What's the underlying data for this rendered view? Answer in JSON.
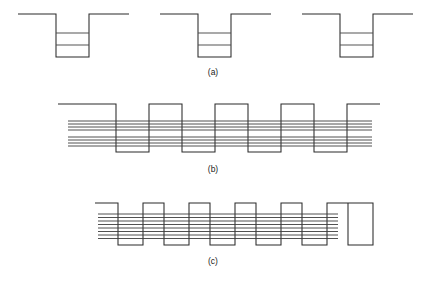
{
  "figure": {
    "background_color": "#ffffff",
    "line_color": "#2b2b2b",
    "level_color": "#4a4a4a",
    "width": 426,
    "height": 281
  },
  "panels": [
    {
      "id": "a",
      "label": "(a)",
      "label_x": 213,
      "label_y": 75,
      "description": "Three isolated quantum wells with discrete bound energy levels",
      "baseline_y": 14,
      "well_bottom_y": 57,
      "wells": [
        {
          "name": "well-left",
          "lead_in_x": 18,
          "left_wall_x": 56,
          "right_wall_x": 89,
          "lead_out_x": 129,
          "levels_y": [
            33,
            45
          ]
        },
        {
          "name": "well-center",
          "lead_in_x": 160,
          "left_wall_x": 198,
          "right_wall_x": 231,
          "lead_out_x": 271,
          "levels_y": [
            33,
            45
          ]
        },
        {
          "name": "well-right",
          "lead_in_x": 302,
          "left_wall_x": 340,
          "right_wall_x": 373,
          "lead_out_x": 413,
          "levels_y": [
            33,
            45
          ]
        }
      ]
    },
    {
      "id": "b",
      "label": "(b)",
      "label_x": 213,
      "label_y": 172,
      "description": "Coupled superlattice of four wells; discrete levels broaden into two minibands",
      "barrier_top_y": 104,
      "well_bottom_y": 152,
      "lead_in_x": 58,
      "lead_out_x": 380,
      "first_wall_x": 116,
      "well_width": 33,
      "barrier_width": 33,
      "well_count": 4,
      "band_left_x": 68,
      "band_right_x": 372,
      "bands": [
        {
          "name": "upper-miniband",
          "lines_y": [
            121,
            124,
            127,
            130
          ]
        },
        {
          "name": "lower-miniband",
          "lines_y": [
            137,
            140,
            143,
            146
          ]
        }
      ]
    },
    {
      "id": "c",
      "label": "(c)",
      "label_x": 213,
      "label_y": 264,
      "description": "Dense superlattice of six narrow wells; levels merge into a single broad band",
      "barrier_top_y": 203,
      "well_bottom_y": 245,
      "lead_in_x": 95,
      "lead_out_x": 342,
      "first_wall_x": 118,
      "well_width": 25,
      "barrier_width": 21,
      "well_count": 6,
      "band_left_x": 98,
      "band_right_x": 338,
      "bands": [
        {
          "name": "broad-band",
          "lines_y": [
            214,
            217.5,
            221,
            224.5,
            228,
            231.5,
            235,
            238.5
          ]
        }
      ]
    }
  ]
}
